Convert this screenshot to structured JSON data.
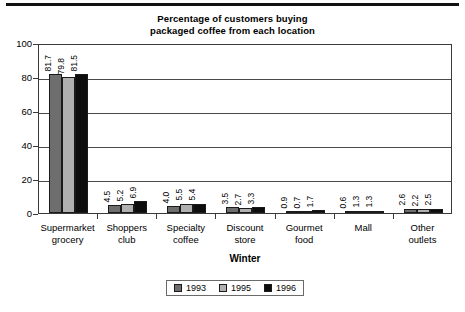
{
  "chart_data": {
    "type": "bar",
    "title": "Percentage of customers buying packaged coffee from each location",
    "title_line1": "Percentage of customers buying",
    "title_line2": "packaged coffee from each location",
    "xlabel": "Winter",
    "ylabel": "",
    "ylim": [
      0,
      100
    ],
    "yticks": [
      0,
      20,
      40,
      60,
      80,
      100
    ],
    "grid": true,
    "legend_position": "bottom",
    "categories": [
      "Supermarket grocery",
      "Shoppers club",
      "Specialty coffee",
      "Discount store",
      "Gourmet food",
      "Mall",
      "Other outlets"
    ],
    "category_lines": [
      [
        "Supermarket",
        "grocery"
      ],
      [
        "Shoppers",
        "club"
      ],
      [
        "Specialty",
        "coffee"
      ],
      [
        "Discount",
        "store"
      ],
      [
        "Gourmet",
        "food"
      ],
      [
        "Mall",
        ""
      ],
      [
        "Other",
        "outlets"
      ]
    ],
    "series": [
      {
        "name": "1993",
        "color": "#6e6e6e",
        "values": [
          81.7,
          4.5,
          4.0,
          3.5,
          0.9,
          0.6,
          2.6
        ]
      },
      {
        "name": "1995",
        "color": "#b0b0b0",
        "values": [
          79.8,
          5.2,
          5.5,
          2.7,
          0.7,
          1.3,
          2.2
        ]
      },
      {
        "name": "1996",
        "color": "#0d0d0d",
        "values": [
          81.5,
          6.9,
          5.4,
          3.3,
          1.7,
          1.3,
          2.5
        ]
      }
    ],
    "value_labels": [
      [
        "81.7",
        "79.8",
        "81.5"
      ],
      [
        "4.5",
        "5.2",
        "6.9"
      ],
      [
        "4.0",
        "5.5",
        "5.4"
      ],
      [
        "3.5",
        "2.7",
        "3.3"
      ],
      [
        "0.9",
        "0.7",
        "1.7"
      ],
      [
        "0.6",
        "1.3",
        "1.3"
      ],
      [
        "2.6",
        "2.2",
        "2.5"
      ]
    ]
  }
}
